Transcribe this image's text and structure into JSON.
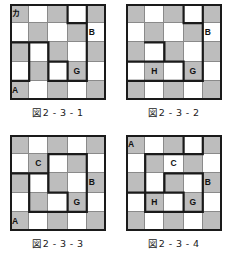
{
  "figures": [
    {
      "id": "fig-2-3-1",
      "caption": "図2 - 3 - 1",
      "shading": [
        [
          1,
          0,
          1,
          0,
          1
        ],
        [
          0,
          1,
          0,
          1,
          0
        ],
        [
          1,
          0,
          1,
          0,
          1
        ],
        [
          0,
          1,
          0,
          1,
          0
        ],
        [
          1,
          0,
          1,
          0,
          1
        ]
      ],
      "labels": [
        {
          "row": 0,
          "col": 0,
          "text": "カ",
          "align": "left"
        },
        {
          "row": 1,
          "col": 4,
          "text": "B",
          "align": "left"
        },
        {
          "row": 3,
          "col": 3,
          "text": "G",
          "align": "center"
        },
        {
          "row": 4,
          "col": 0,
          "text": "A",
          "align": "left"
        }
      ],
      "path": "M 57.6 0 L 57.6 19.2 L 76.8 19.2 L 76.8 76.8 L 57.6 76.8 L 57.6 57.6 L 38.4 57.6 L 38.4 38.4 L 19.2 38.4 L 19.2 76.8 L 0 76.8 L 0 38.4 L 19.2 38.4 M 76.8 0 L 76.8 19.2 M 38.4 57.6 L 38.4 76.8 L 57.6 76.8"
    },
    {
      "id": "fig-2-3-2",
      "caption": "図2 - 3 - 2",
      "shading": [
        [
          1,
          0,
          1,
          0,
          1
        ],
        [
          0,
          1,
          0,
          1,
          0
        ],
        [
          1,
          0,
          1,
          0,
          1
        ],
        [
          0,
          1,
          0,
          1,
          0
        ],
        [
          1,
          0,
          1,
          0,
          1
        ]
      ],
      "labels": [
        {
          "row": 1,
          "col": 4,
          "text": "B",
          "align": "left"
        },
        {
          "row": 3,
          "col": 3,
          "text": "G",
          "align": "center"
        },
        {
          "row": 3,
          "col": 1,
          "text": "H",
          "align": "center"
        }
      ],
      "path": "M 57.6 0 L 57.6 19.2 L 76.8 19.2 L 76.8 76.8 L 57.6 76.8 L 57.6 57.6 L 38.4 57.6 L 38.4 38.4 L 19.2 38.4 M 76.8 0 L 76.8 19.2 M 0 57.6 L 0 76.8 L 57.6 76.8 M 0 57.6 L 38.4 57.6"
    },
    {
      "id": "fig-2-3-3",
      "caption": "図2 - 3 - 3",
      "shading": [
        [
          1,
          0,
          1,
          0,
          1
        ],
        [
          0,
          1,
          0,
          1,
          0
        ],
        [
          1,
          0,
          1,
          0,
          1
        ],
        [
          0,
          1,
          0,
          1,
          0
        ],
        [
          1,
          0,
          1,
          0,
          1
        ]
      ],
      "labels": [
        {
          "row": 1,
          "col": 1,
          "text": "C",
          "align": "center"
        },
        {
          "row": 2,
          "col": 4,
          "text": "B",
          "align": "left"
        },
        {
          "row": 3,
          "col": 3,
          "text": "G",
          "align": "center"
        },
        {
          "row": 4,
          "col": 0,
          "text": "A",
          "align": "left"
        }
      ],
      "path": "M 38.4 19.2 L 76.8 19.2 L 76.8 76.8 L 57.6 76.8 L 57.6 57.6 L 38.4 57.6 L 38.4 38.4 L 19.2 38.4 L 19.2 76.8 M 38.4 19.2 L 38.4 38.4 M 0 38.4 L 19.2 38.4 M 19.2 76.8 L 57.6 76.8"
    },
    {
      "id": "fig-2-3-4",
      "caption": "図2 - 3 - 4",
      "shading": [
        [
          1,
          0,
          1,
          0,
          1
        ],
        [
          0,
          1,
          0,
          1,
          0
        ],
        [
          1,
          0,
          1,
          0,
          1
        ],
        [
          0,
          1,
          0,
          1,
          0
        ],
        [
          1,
          0,
          1,
          0,
          1
        ]
      ],
      "labels": [
        {
          "row": 0,
          "col": 0,
          "text": "A",
          "align": "left"
        },
        {
          "row": 1,
          "col": 2,
          "text": "C",
          "align": "center"
        },
        {
          "row": 2,
          "col": 4,
          "text": "B",
          "align": "left"
        },
        {
          "row": 3,
          "col": 3,
          "text": "G",
          "align": "center"
        },
        {
          "row": 3,
          "col": 1,
          "text": "H",
          "align": "center"
        }
      ],
      "path": "M 57.6 0 L 57.6 19.2 L 19.2 19.2 L 19.2 57.6 L 38.4 57.6 L 38.4 38.4 L 76.8 38.4 L 76.8 76.8 L 57.6 76.8 L 57.6 57.6 L 38.4 57.6 M 57.6 19.2 L 76.8 19.2 M 76.8 0 L 76.8 19.2 M 0 57.6 L 19.2 57.6 M 19.2 57.6 L 19.2 76.8 M 19.2 76.8 L 57.6 76.8"
    }
  ]
}
